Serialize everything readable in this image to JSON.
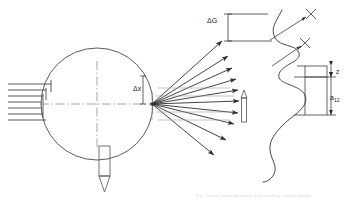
{
  "diagram": {
    "type": "technical-line-drawing",
    "background_color": "#ffffff",
    "line_color": "#3a3a3a",
    "thin_line_color": "#555555",
    "centerline_color": "#777777"
  },
  "labels": {
    "delta_g": "ΔG",
    "delta_x": "Δx",
    "z": "z",
    "a12_base": "a",
    "a12_sub": "12",
    "caption": "Fig. Contact zone geometry and resulting surface profile"
  },
  "elements": {
    "wheel": {
      "name": "circle-workpiece",
      "cx": 97,
      "cy": 104,
      "r": 56
    },
    "incoming_lines": {
      "name": "parallel-incoming-rays",
      "count": 7,
      "x_start": 8,
      "x_end": 50,
      "y_values": [
        84,
        90,
        96,
        102,
        108,
        114,
        120
      ]
    },
    "focal_point": {
      "name": "contact-focal-point",
      "x": 152,
      "y": 104
    },
    "fan_rays": {
      "name": "diverging-ray-fan",
      "count": 10,
      "angles_deg": [
        -42,
        -33,
        -25,
        -17,
        -9,
        -2,
        6,
        14,
        25,
        38
      ]
    },
    "delta_x_dimension": {
      "name": "delta-x-dimension",
      "x": 152,
      "y_top": 72,
      "y_bottom": 126
    },
    "delta_g_dimension": {
      "name": "delta-g-dimension",
      "x": 228,
      "y_top": 16,
      "y_bottom": 40
    },
    "down_pointer": {
      "name": "downward-tool-pointer",
      "x": 105,
      "y_top": 146,
      "y_bottom": 192
    },
    "mid_pointer": {
      "name": "mid-arrow-pointer",
      "x": 244,
      "y_top": 90,
      "y_bottom": 122
    },
    "profile_curve": {
      "name": "serpentine-surface-profile",
      "description": "wavy vertical roughness profile"
    },
    "cross_markers": {
      "name": "cross-markers",
      "count": 2,
      "positions": [
        [
          311,
          14
        ],
        [
          305,
          43
        ]
      ]
    },
    "right_dimensions": {
      "name": "right-dimension-stack",
      "z_block": {
        "x": 310,
        "y_top": 65,
        "y_bottom": 78
      },
      "a12_block": {
        "x": 310,
        "y_top": 78,
        "y_bottom": 119
      }
    }
  }
}
